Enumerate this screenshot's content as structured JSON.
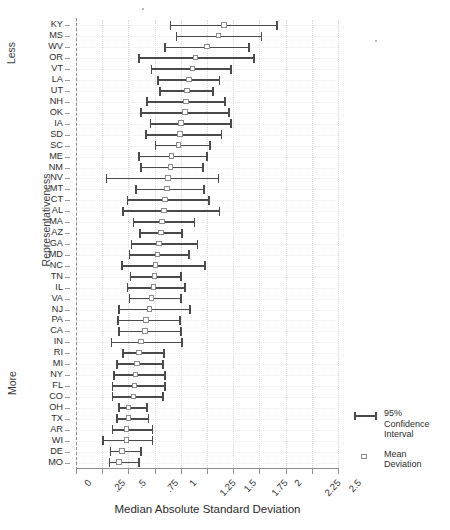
{
  "chart_data": {
    "type": "scatter",
    "title": "",
    "xlabel": "Median Absolute Standard Deviation",
    "ylabel": "Representativeness",
    "ylabel_groups": [
      "Less",
      "Representativeness",
      "More"
    ],
    "xlim": [
      0,
      2.5
    ],
    "xticks": [
      0,
      0.25,
      0.5,
      0.75,
      1,
      1.25,
      1.5,
      1.75,
      2,
      2.25,
      2.5
    ],
    "xtick_labels": [
      "0",
      ".25",
      ".5",
      ".75",
      "1",
      "1.25",
      "1.5",
      "1.75",
      "2",
      "2.25",
      "2.5"
    ],
    "grid": true,
    "legend_position": "right",
    "legend": [
      {
        "key": "errorbar",
        "label_lines": [
          "95%",
          "Confidence",
          "Interval"
        ]
      },
      {
        "key": "square-marker",
        "label_lines": [
          "Mean",
          "Deviation"
        ]
      }
    ],
    "series": [
      {
        "name": "Mean Deviation",
        "marker": "open-square",
        "color": "#8c8c8c"
      },
      {
        "name": "95% Confidence Interval",
        "marker": "errorbar",
        "color": "#4a4a4a"
      }
    ],
    "categories": [
      "KY",
      "MS",
      "WV",
      "OR",
      "VT",
      "LA",
      "UT",
      "NH",
      "OK",
      "IA",
      "SD",
      "SC",
      "ME",
      "NM",
      "NV",
      "MT",
      "CT",
      "AL",
      "MA",
      "AZ",
      "GA",
      "MD",
      "NC",
      "TN",
      "IL",
      "VA",
      "NJ",
      "PA",
      "CA",
      "IN",
      "RI",
      "MI",
      "NY",
      "FL",
      "CO",
      "OH",
      "TX",
      "AR",
      "WI",
      "DE",
      "MO"
    ],
    "points": [
      {
        "state": "KY",
        "mean": 1.41,
        "low": 0.9,
        "high": 1.92
      },
      {
        "state": "MS",
        "mean": 1.36,
        "low": 0.96,
        "high": 1.77
      },
      {
        "state": "WV",
        "mean": 1.25,
        "low": 0.85,
        "high": 1.65
      },
      {
        "state": "OR",
        "mean": 1.14,
        "low": 0.6,
        "high": 1.7
      },
      {
        "state": "VT",
        "mean": 1.11,
        "low": 0.72,
        "high": 1.48
      },
      {
        "state": "LA",
        "mean": 1.08,
        "low": 0.78,
        "high": 1.37
      },
      {
        "state": "UT",
        "mean": 1.06,
        "low": 0.8,
        "high": 1.31
      },
      {
        "state": "NH",
        "mean": 1.05,
        "low": 0.68,
        "high": 1.42
      },
      {
        "state": "OK",
        "mean": 1.04,
        "low": 0.62,
        "high": 1.46
      },
      {
        "state": "IA",
        "mean": 1.0,
        "low": 0.71,
        "high": 1.48
      },
      {
        "state": "SD",
        "mean": 0.99,
        "low": 0.67,
        "high": 1.39
      },
      {
        "state": "SC",
        "mean": 0.98,
        "low": 0.76,
        "high": 1.28
      },
      {
        "state": "ME",
        "mean": 0.91,
        "low": 0.6,
        "high": 1.25
      },
      {
        "state": "NM",
        "mean": 0.9,
        "low": 0.62,
        "high": 1.21
      },
      {
        "state": "NV",
        "mean": 0.88,
        "low": 0.29,
        "high": 1.36
      },
      {
        "state": "MT",
        "mean": 0.87,
        "low": 0.57,
        "high": 1.22
      },
      {
        "state": "CT",
        "mean": 0.85,
        "low": 0.49,
        "high": 1.27
      },
      {
        "state": "AL",
        "mean": 0.84,
        "low": 0.45,
        "high": 1.37
      },
      {
        "state": "MA",
        "mean": 0.82,
        "low": 0.55,
        "high": 1.13
      },
      {
        "state": "AZ",
        "mean": 0.81,
        "low": 0.61,
        "high": 1.01
      },
      {
        "state": "GA",
        "mean": 0.79,
        "low": 0.53,
        "high": 1.16
      },
      {
        "state": "MD",
        "mean": 0.78,
        "low": 0.51,
        "high": 1.08
      },
      {
        "state": "NC",
        "mean": 0.76,
        "low": 0.44,
        "high": 1.23
      },
      {
        "state": "TN",
        "mean": 0.75,
        "low": 0.52,
        "high": 1.0
      },
      {
        "state": "IL",
        "mean": 0.74,
        "low": 0.49,
        "high": 1.04
      },
      {
        "state": "VA",
        "mean": 0.72,
        "low": 0.51,
        "high": 1.0
      },
      {
        "state": "NJ",
        "mean": 0.7,
        "low": 0.41,
        "high": 1.09
      },
      {
        "state": "PA",
        "mean": 0.67,
        "low": 0.4,
        "high": 0.99
      },
      {
        "state": "CA",
        "mean": 0.66,
        "low": 0.41,
        "high": 1.0
      },
      {
        "state": "IN",
        "mean": 0.62,
        "low": 0.34,
        "high": 1.01
      },
      {
        "state": "RI",
        "mean": 0.6,
        "low": 0.45,
        "high": 0.84
      },
      {
        "state": "MI",
        "mean": 0.58,
        "low": 0.39,
        "high": 0.83
      },
      {
        "state": "NY",
        "mean": 0.57,
        "low": 0.36,
        "high": 0.85
      },
      {
        "state": "FL",
        "mean": 0.56,
        "low": 0.35,
        "high": 0.85
      },
      {
        "state": "CO",
        "mean": 0.55,
        "low": 0.35,
        "high": 0.83
      },
      {
        "state": "OH",
        "mean": 0.5,
        "low": 0.41,
        "high": 0.68
      },
      {
        "state": "TX",
        "mean": 0.5,
        "low": 0.39,
        "high": 0.69
      },
      {
        "state": "AR",
        "mean": 0.48,
        "low": 0.35,
        "high": 0.73
      },
      {
        "state": "WI",
        "mean": 0.48,
        "low": 0.26,
        "high": 0.73
      },
      {
        "state": "DE",
        "mean": 0.44,
        "low": 0.33,
        "high": 0.62
      },
      {
        "state": "MO",
        "mean": 0.41,
        "low": 0.32,
        "high": 0.6
      }
    ]
  }
}
